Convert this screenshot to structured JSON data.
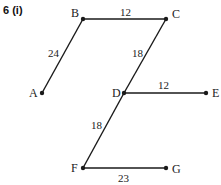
{
  "question": {
    "number": "6",
    "part": "(i)",
    "label": "6 (i)"
  },
  "points": {
    "A": {
      "label": "A",
      "x": 42,
      "y": 93
    },
    "B": {
      "label": "B",
      "x": 83,
      "y": 19
    },
    "C": {
      "label": "C",
      "x": 166,
      "y": 19
    },
    "D": {
      "label": "D",
      "x": 124,
      "y": 93
    },
    "E": {
      "label": "E",
      "x": 206,
      "y": 93
    },
    "F": {
      "label": "F",
      "x": 83,
      "y": 168
    },
    "G": {
      "label": "G",
      "x": 166,
      "y": 168
    }
  },
  "edges": [
    {
      "from": "A",
      "to": "B",
      "length": "24"
    },
    {
      "from": "B",
      "to": "C",
      "length": "12"
    },
    {
      "from": "C",
      "to": "D",
      "length": "18"
    },
    {
      "from": "D",
      "to": "E",
      "length": "12"
    },
    {
      "from": "D",
      "to": "F",
      "length": "18"
    },
    {
      "from": "F",
      "to": "G",
      "length": "23"
    }
  ],
  "colors": {
    "line": "#1a1a1a",
    "text": "#222222"
  }
}
